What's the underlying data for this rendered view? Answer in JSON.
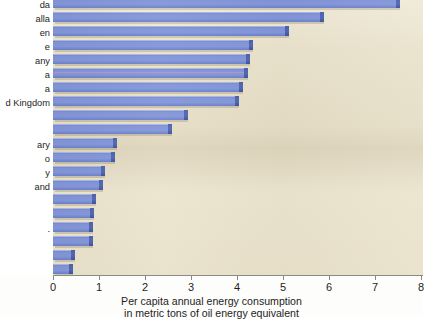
{
  "figure": {
    "caption_line1": "Per capita annual energy consumption",
    "caption_line2": "in metric tons of oil energy equivalent",
    "plot_background": "#e9e1c9",
    "bar_color": "#7b8ed3",
    "bar_side_color": "#4d61ab",
    "axis_color": "#8a8a86"
  },
  "chart_data": {
    "type": "bar",
    "orientation": "horizontal",
    "title": "",
    "subtitle": "",
    "xlabel": "Per capita annual energy consumption in metric tons of oil energy equivalent",
    "ylabel": "",
    "xlim": [
      0,
      8
    ],
    "xticks": [
      0,
      1,
      2,
      3,
      4,
      5,
      6,
      7,
      8
    ],
    "xtick_labels": [
      "0",
      "1",
      "2",
      "3",
      "4",
      "5",
      "6",
      "7",
      "8"
    ],
    "grid": false,
    "legend": null,
    "note": "Country labels are clipped by the left edge of the screenshot crop; only partial text is visible.",
    "categories": [
      "da",
      "alla",
      "en",
      "e",
      "any",
      "a",
      "a",
      "d Kingdom",
      "",
      "",
      "ary",
      "o",
      "y",
      "and",
      "",
      "",
      "",
      "",
      "",
      ""
    ],
    "values": [
      7.45,
      5.8,
      5.05,
      4.25,
      4.2,
      4.15,
      4.05,
      3.95,
      2.85,
      2.5,
      1.3,
      1.25,
      1.05,
      1.0,
      0.85,
      0.8,
      0.78,
      0.78,
      0.4,
      0.35
    ]
  },
  "labels": [
    {
      "text": "da",
      "top": 1
    },
    {
      "text": "alla",
      "top": 15
    },
    {
      "text": "en",
      "top": 29
    },
    {
      "text": "e",
      "top": 43
    },
    {
      "text": "any",
      "top": 57
    },
    {
      "text": "a",
      "top": 71
    },
    {
      "text": "a",
      "top": 85
    },
    {
      "text": "d Kingdom",
      "top": 99
    },
    {
      "text": "ary",
      "top": 141
    },
    {
      "text": "o",
      "top": 155
    },
    {
      "text": "y",
      "top": 169
    },
    {
      "text": "and",
      "top": 183
    },
    {
      "text": ".",
      "top": 225
    }
  ],
  "xaxis": {
    "ticks": [
      {
        "label": "0",
        "value": 0
      },
      {
        "label": "1",
        "value": 1
      },
      {
        "label": "2",
        "value": 2
      },
      {
        "label": "3",
        "value": 3
      },
      {
        "label": "4",
        "value": 4
      },
      {
        "label": "5",
        "value": 5
      },
      {
        "label": "6",
        "value": 6
      },
      {
        "label": "7",
        "value": 7
      },
      {
        "label": "8",
        "value": 8
      }
    ]
  }
}
